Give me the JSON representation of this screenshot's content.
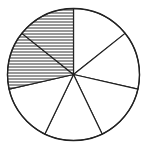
{
  "chart_data": {
    "type": "pie",
    "title": "",
    "total_slices": 7,
    "shaded_slices": 2,
    "fraction_shaded": "2/7",
    "start_angle_deg": 0,
    "direction": "clockwise",
    "slices": [
      {
        "index": 0,
        "value": 1,
        "shaded": false
      },
      {
        "index": 1,
        "value": 1,
        "shaded": false
      },
      {
        "index": 2,
        "value": 1,
        "shaded": false
      },
      {
        "index": 3,
        "value": 1,
        "shaded": false
      },
      {
        "index": 4,
        "value": 1,
        "shaded": false
      },
      {
        "index": 5,
        "value": 1,
        "shaded": true
      },
      {
        "index": 6,
        "value": 1,
        "shaded": true
      }
    ],
    "shading_pattern": "horizontal-lines",
    "colors": {
      "stroke": "#222222",
      "fill": "#ffffff",
      "hatch": "#333333"
    }
  }
}
